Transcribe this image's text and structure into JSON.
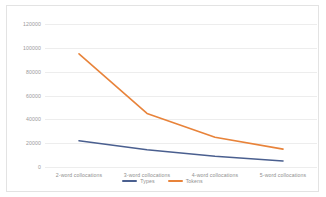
{
  "chart_data": {
    "type": "line",
    "title": "",
    "subtitle": "",
    "xlabel": "",
    "ylabel": "",
    "categories": [
      "2-word collocations",
      "3-word collocations",
      "4-word collocations",
      "5-word collocations"
    ],
    "series": [
      {
        "name": "Types",
        "color": "#4a5f8f",
        "values": [
          22000,
          14500,
          9000,
          5000
        ]
      },
      {
        "name": "Tokens",
        "color": "#e8833a",
        "values": [
          95000,
          45000,
          25000,
          15000
        ]
      }
    ],
    "ylim": [
      0,
      120000
    ],
    "yticks": [
      0,
      20000,
      40000,
      60000,
      80000,
      100000,
      120000
    ],
    "ytick_labels": [
      "0",
      "20000",
      "40000",
      "60000",
      "80000",
      "100000",
      "120000"
    ],
    "grid": "horizontal",
    "legend_position": "bottom-center"
  },
  "colors": {
    "types_line": "#4a5f8f",
    "tokens_line": "#e8833a",
    "gridline": "#ededed",
    "frame_border": "#e3e3e3",
    "tick_text": "#909090",
    "background": "#ffffff"
  },
  "legend": {
    "entries": [
      {
        "label": "Types"
      },
      {
        "label": "Tokens"
      }
    ]
  }
}
